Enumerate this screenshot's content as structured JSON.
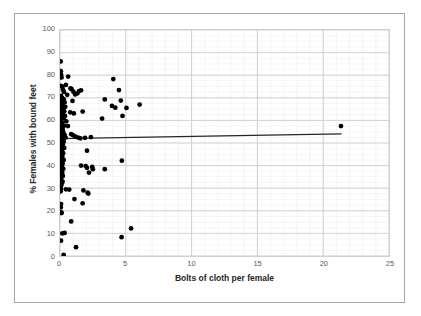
{
  "chart_data": {
    "type": "scatter",
    "title": "",
    "xlabel": "Bolts of cloth per female",
    "ylabel": "% Females with bound feet",
    "xlim": [
      0,
      25
    ],
    "ylim": [
      0,
      100
    ],
    "xticks": [
      0,
      5,
      10,
      15,
      20,
      25
    ],
    "yticks": [
      0,
      10,
      20,
      30,
      40,
      50,
      60,
      70,
      80,
      90,
      100
    ],
    "grid": "major and minor gridlines, light gray",
    "legend": "none",
    "marker_color": "#000000",
    "trendline": {
      "label": "linear trendline",
      "color": "#262626",
      "x_start": 0.0,
      "y_start": 51.9,
      "x_end": 21.4,
      "y_end": 54.0
    },
    "points": [
      [
        0.05,
        86.1
      ],
      [
        0.06,
        81.8
      ],
      [
        0.08,
        80.3
      ],
      [
        0.12,
        79.0
      ],
      [
        0.05,
        75.3
      ],
      [
        0.18,
        74.9
      ],
      [
        0.45,
        75.7
      ],
      [
        0.22,
        73.6
      ],
      [
        0.3,
        72.6
      ],
      [
        0.55,
        71.3
      ],
      [
        0.08,
        70.8
      ],
      [
        0.15,
        70.0
      ],
      [
        0.28,
        69.4
      ],
      [
        0.1,
        68.6
      ],
      [
        0.35,
        68.0
      ],
      [
        0.12,
        67.4
      ],
      [
        0.2,
        66.5
      ],
      [
        0.4,
        66.0
      ],
      [
        0.14,
        65.5
      ],
      [
        0.25,
        65.0
      ],
      [
        0.09,
        64.4
      ],
      [
        0.32,
        64.0
      ],
      [
        0.16,
        63.5
      ],
      [
        0.06,
        63.0
      ],
      [
        0.22,
        62.5
      ],
      [
        0.38,
        62.0
      ],
      [
        0.11,
        61.4
      ],
      [
        0.28,
        61.0
      ],
      [
        0.07,
        60.3
      ],
      [
        0.48,
        59.6
      ],
      [
        0.18,
        59.0
      ],
      [
        0.13,
        58.2
      ],
      [
        0.3,
        57.6
      ],
      [
        0.09,
        56.9
      ],
      [
        0.2,
        56.2
      ],
      [
        0.05,
        55.4
      ],
      [
        0.25,
        54.8
      ],
      [
        0.14,
        54.1
      ],
      [
        0.35,
        53.5
      ],
      [
        0.1,
        52.9
      ],
      [
        0.42,
        52.4
      ],
      [
        0.19,
        51.8
      ],
      [
        0.08,
        51.2
      ],
      [
        0.28,
        50.6
      ],
      [
        0.12,
        49.9
      ],
      [
        0.22,
        49.2
      ],
      [
        0.06,
        48.5
      ],
      [
        0.32,
        47.8
      ],
      [
        0.16,
        47.0
      ],
      [
        0.1,
        46.2
      ],
      [
        0.24,
        45.5
      ],
      [
        0.07,
        44.8
      ],
      [
        0.18,
        44.0
      ],
      [
        0.13,
        43.2
      ],
      [
        0.28,
        42.5
      ],
      [
        0.09,
        41.8
      ],
      [
        0.2,
        41.0
      ],
      [
        0.15,
        40.2
      ],
      [
        0.11,
        39.4
      ],
      [
        0.25,
        38.6
      ],
      [
        0.08,
        37.8
      ],
      [
        0.17,
        37.0
      ],
      [
        0.12,
        36.2
      ],
      [
        0.22,
        35.4
      ],
      [
        0.1,
        34.6
      ],
      [
        0.06,
        33.8
      ],
      [
        0.19,
        33.0
      ],
      [
        0.14,
        32.2
      ],
      [
        0.09,
        31.2
      ],
      [
        0.07,
        29.8
      ],
      [
        0.45,
        29.5
      ],
      [
        0.05,
        28.6
      ],
      [
        0.08,
        23.0
      ],
      [
        0.06,
        21.5
      ],
      [
        0.1,
        19.3
      ],
      [
        0.12,
        19.0
      ],
      [
        0.18,
        10.0
      ],
      [
        0.08,
        6.8
      ],
      [
        0.28,
        0.5
      ],
      [
        0.62,
        79.4
      ],
      [
        0.8,
        74.2
      ],
      [
        0.88,
        73.8
      ],
      [
        1.02,
        72.7
      ],
      [
        1.15,
        71.5
      ],
      [
        1.32,
        72.0
      ],
      [
        1.45,
        73.0
      ],
      [
        1.6,
        73.3
      ],
      [
        0.95,
        68.6
      ],
      [
        0.78,
        63.6
      ],
      [
        1.05,
        63.1
      ],
      [
        1.72,
        63.9
      ],
      [
        0.6,
        57.5
      ],
      [
        0.85,
        53.9
      ],
      [
        1.0,
        53.4
      ],
      [
        1.18,
        52.8
      ],
      [
        1.38,
        52.4
      ],
      [
        1.55,
        52.1
      ],
      [
        1.9,
        52.3
      ],
      [
        2.35,
        52.6
      ],
      [
        2.05,
        46.6
      ],
      [
        1.6,
        40.0
      ],
      [
        1.95,
        39.8
      ],
      [
        2.05,
        39.0
      ],
      [
        2.45,
        39.4
      ],
      [
        2.2,
        36.9
      ],
      [
        2.5,
        38.4
      ],
      [
        0.7,
        29.4
      ],
      [
        1.78,
        29.0
      ],
      [
        2.1,
        28.0
      ],
      [
        2.15,
        27.6
      ],
      [
        1.72,
        23.3
      ],
      [
        1.1,
        25.2
      ],
      [
        0.85,
        15.3
      ],
      [
        0.35,
        10.2
      ],
      [
        1.22,
        3.9
      ],
      [
        3.4,
        69.3
      ],
      [
        4.05,
        78.3
      ],
      [
        4.48,
        73.4
      ],
      [
        3.95,
        66.4
      ],
      [
        4.2,
        65.6
      ],
      [
        4.62,
        68.8
      ],
      [
        4.75,
        62.0
      ],
      [
        5.05,
        65.5
      ],
      [
        3.2,
        60.8
      ],
      [
        6.05,
        67.0
      ],
      [
        4.7,
        42.2
      ],
      [
        3.4,
        38.4
      ],
      [
        4.68,
        8.3
      ],
      [
        5.4,
        12.2
      ],
      [
        21.35,
        57.5
      ]
    ]
  }
}
